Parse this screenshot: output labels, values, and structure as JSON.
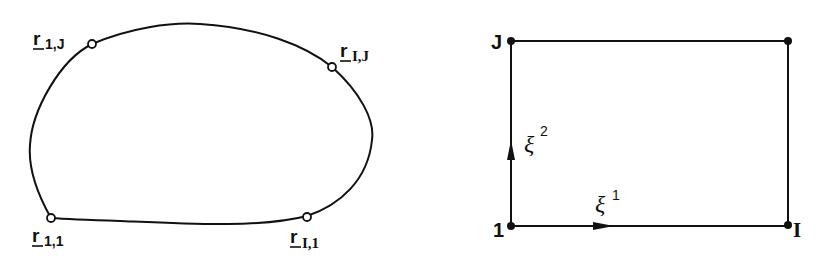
{
  "left_figure": {
    "description": "physical domain boundary curve with four corner points",
    "points": [
      {
        "id": "r_1_J",
        "base": "r",
        "sub": "1,J",
        "x": 92,
        "y": 44
      },
      {
        "id": "r_I_J",
        "base": "r",
        "sub": "I,J",
        "x": 332,
        "y": 67
      },
      {
        "id": "r_1_1",
        "base": "r",
        "sub": "1,1",
        "x": 51,
        "y": 218
      },
      {
        "id": "r_I_1",
        "base": "r",
        "sub": "I,1",
        "x": 307,
        "y": 217
      }
    ]
  },
  "right_figure": {
    "description": "computational rectangle",
    "corner_labels": {
      "top_left": "J",
      "bottom_left": "1",
      "bottom_right": "I"
    },
    "axes": [
      {
        "symbol": "ξ",
        "superscript": "2",
        "direction": "vertical"
      },
      {
        "symbol": "ξ",
        "superscript": "1",
        "direction": "horizontal"
      }
    ]
  },
  "colors": {
    "ink": "#111111",
    "background": "#ffffff"
  }
}
